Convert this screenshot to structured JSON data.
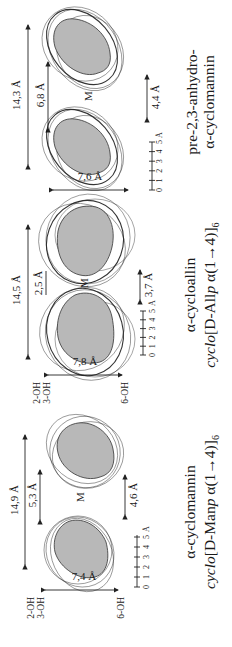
{
  "figure": {
    "orientation": "rotated 90 degrees counter-clockwise",
    "panels": [
      {
        "id": "alpha-cyclomannin",
        "title": "α-cyclomannin",
        "formula_prefix": "cyclo",
        "formula_body": "[D-Man",
        "formula_p": "p",
        "formula_link": " α(1→4)]",
        "formula_sub": "6",
        "width_total": "14,9 Å",
        "cavity_top": "5,3 Å",
        "cavity_bottom": "4,6 Å",
        "height": "7,4 Å",
        "rim_secondary": [
          "2-OH",
          "3-OH"
        ],
        "rim_primary": "6-OH",
        "center_label": "M",
        "scale_ticks": [
          "0",
          "1",
          "2",
          "3",
          "4",
          "5"
        ],
        "scale_unit": "Å"
      },
      {
        "id": "alpha-cycloallin",
        "title": "α-cycloallin",
        "formula_prefix": "cyclo",
        "formula_body": "[D-All",
        "formula_p": "p",
        "formula_link": " α(1→4)]",
        "formula_sub": "6",
        "width_total": "14,5 Å",
        "cavity_top": "2,5 Å",
        "cavity_bottom": "3,7 Å",
        "height": "7,8 Å",
        "rim_secondary": [
          "2-OH",
          "3-OH"
        ],
        "rim_primary": "6-OH",
        "center_label": "M",
        "scale_ticks": [
          "0",
          "1",
          "2",
          "3",
          "4",
          "5"
        ],
        "scale_unit": "Å"
      },
      {
        "id": "pre-2-3-anhydro-alpha-cyclomannin",
        "title_line1": "pre-2,3-anhydro-",
        "title_line2": "α-cyclomannin",
        "width_total": "14,3 Å",
        "cavity_top": "6,8 Å",
        "cavity_bottom": "4,4 Å",
        "height": "7,6 Å",
        "center_label": "M",
        "scale_ticks": [
          "0",
          "1",
          "2",
          "3",
          "4",
          "5"
        ],
        "scale_unit": "Å"
      }
    ]
  }
}
